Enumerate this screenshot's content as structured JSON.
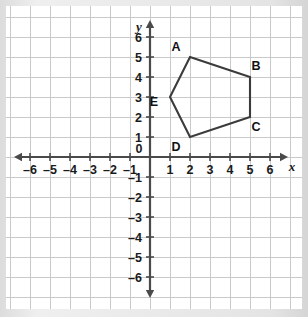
{
  "figure": {
    "background_color": "#ffffff",
    "frame_color": "#e4e4e4",
    "grid_color": "#c9c9c9",
    "axis_color": "#4a4a4a",
    "shape_color": "#3b3b3b"
  },
  "chart_data": {
    "type": "scatter",
    "title": "",
    "xlabel": "x",
    "ylabel": "y",
    "xlim": [
      -6,
      6
    ],
    "ylim": [
      -6,
      6
    ],
    "grid": true,
    "legend": "none",
    "x_ticks": [
      -6,
      -5,
      -4,
      -3,
      -2,
      -1,
      0,
      1,
      2,
      3,
      4,
      5,
      6
    ],
    "y_ticks": [
      -6,
      -5,
      -4,
      -3,
      -2,
      -1,
      1,
      2,
      3,
      4,
      5,
      6
    ],
    "x_tick_labels": [
      "–6",
      "–5",
      "–4",
      "–3",
      "–2",
      "–1",
      "0",
      "1",
      "2",
      "3",
      "4",
      "5",
      "6"
    ],
    "y_tick_labels": [
      "–6",
      "–5",
      "–4",
      "–3",
      "–2",
      "–1",
      "1",
      "2",
      "3",
      "4",
      "5",
      "6"
    ],
    "origin_label": "0",
    "axis_labels": {
      "x": "x",
      "y": "y"
    },
    "series": [
      {
        "name": "Pentagon ABCDE",
        "kind": "polygon",
        "closed": true,
        "points": [
          {
            "label": "A",
            "x": 2,
            "y": 5,
            "label_dx": -14,
            "label_dy": -6
          },
          {
            "label": "B",
            "x": 5,
            "y": 4,
            "label_dx": 6,
            "label_dy": -7
          },
          {
            "label": "C",
            "x": 5,
            "y": 2,
            "label_dx": 6,
            "label_dy": 14
          },
          {
            "label": "D",
            "x": 2,
            "y": 1,
            "label_dx": -14,
            "label_dy": 14
          },
          {
            "label": "E",
            "x": 1,
            "y": 3,
            "label_dx": -16,
            "label_dy": 9
          }
        ]
      }
    ]
  }
}
